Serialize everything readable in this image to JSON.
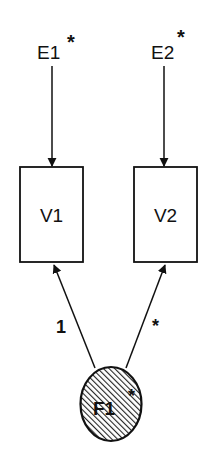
{
  "diagram": {
    "type": "path-diagram",
    "errors": [
      {
        "id": "E1",
        "label": "E1",
        "marker": "*"
      },
      {
        "id": "E2",
        "label": "E2",
        "marker": "*"
      }
    ],
    "observed": [
      {
        "id": "V1",
        "label": "V1"
      },
      {
        "id": "V2",
        "label": "V2"
      }
    ],
    "latent": {
      "id": "F1",
      "label": "F1",
      "marker": "*"
    },
    "paths": [
      {
        "from": "E1",
        "to": "V1",
        "label": ""
      },
      {
        "from": "E2",
        "to": "V2",
        "label": ""
      },
      {
        "from": "F1",
        "to": "V1",
        "label": "1"
      },
      {
        "from": "F1",
        "to": "V2",
        "label": "*"
      }
    ],
    "colors": {
      "stroke": "#111111",
      "background": "#ffffff",
      "hatch": "#222222"
    }
  }
}
